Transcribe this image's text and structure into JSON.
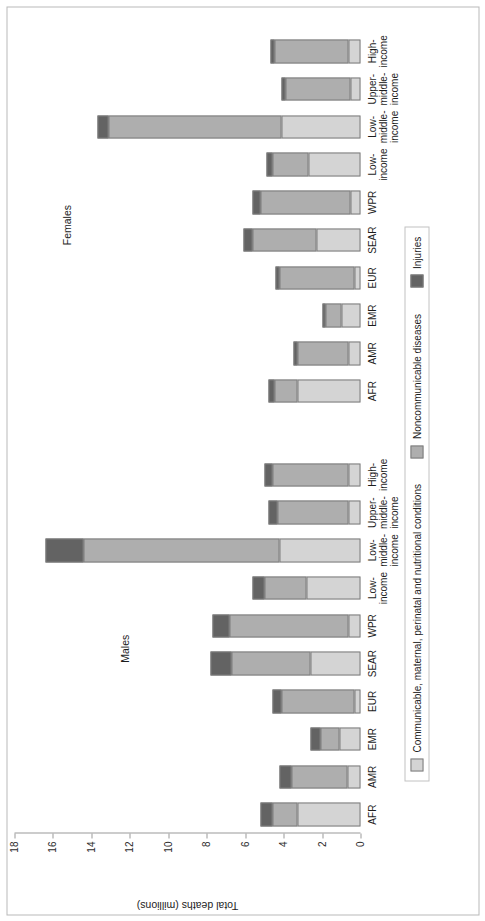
{
  "chart_data": {
    "type": "bar",
    "subtype": "stacked-bar",
    "title": "",
    "xlabel": "",
    "ylabel": "Total deaths (millions)",
    "ylim": [
      0,
      18
    ],
    "yticks": [
      0,
      2,
      4,
      6,
      8,
      10,
      12,
      14,
      16,
      18
    ],
    "grid": false,
    "orientation": "vertical-bars-rotated-90",
    "legend_position": "bottom",
    "groups": [
      "Males",
      "Females"
    ],
    "categories": [
      "AFR",
      "AMR",
      "EMR",
      "EUR",
      "SEAR",
      "WPR",
      "Low-\nincome",
      "Low-\nmiddle-\nincome",
      "Upper-\nmiddle-\nincome",
      "High-\nincome"
    ],
    "series": [
      {
        "name": "Communicable, maternal, perinatal and nutritional conditions",
        "color": "#d4d4d4",
        "males": [
          3.3,
          0.7,
          1.1,
          0.3,
          2.6,
          0.6,
          2.8,
          4.2,
          0.6,
          0.6
        ],
        "females": [
          3.3,
          0.6,
          1.0,
          0.3,
          2.3,
          0.5,
          2.7,
          4.1,
          0.5,
          0.6
        ]
      },
      {
        "name": "Noncommunicable diseases",
        "color": "#aeaeae",
        "males": [
          1.3,
          2.9,
          1.0,
          3.8,
          4.1,
          6.2,
          2.2,
          10.2,
          3.7,
          4.0
        ],
        "females": [
          1.2,
          2.7,
          0.8,
          3.9,
          3.3,
          4.7,
          1.9,
          9.0,
          3.4,
          3.9
        ]
      },
      {
        "name": "Injuries",
        "color": "#636363",
        "males": [
          0.6,
          0.6,
          0.5,
          0.5,
          1.1,
          0.9,
          0.6,
          2.0,
          0.5,
          0.4
        ],
        "females": [
          0.3,
          0.2,
          0.2,
          0.2,
          0.5,
          0.4,
          0.3,
          0.6,
          0.2,
          0.2
        ]
      }
    ],
    "totals": {
      "males": [
        5.2,
        4.2,
        2.6,
        4.6,
        7.8,
        7.7,
        5.6,
        16.4,
        4.8,
        5.0
      ],
      "females": [
        4.8,
        3.5,
        2.0,
        4.4,
        6.1,
        5.6,
        4.9,
        13.7,
        4.1,
        4.7
      ]
    }
  },
  "axis": {
    "ylabel": "Total deaths (millions)",
    "tick_labels": [
      "0",
      "2",
      "4",
      "6",
      "8",
      "10",
      "12",
      "14",
      "16",
      "18"
    ]
  },
  "group_labels": {
    "males": "Males",
    "females": "Females"
  },
  "category_labels": [
    "AFR",
    "AMR",
    "EMR",
    "EUR",
    "SEAR",
    "WPR",
    "Low-\nincome",
    "Low-\nmiddle-\nincome",
    "Upper-\nmiddle-\nincome",
    "High-\nincome"
  ],
  "legend": {
    "items": [
      {
        "label": "Communicable, maternal, perinatal and nutritional conditions",
        "color": "#d4d4d4"
      },
      {
        "label": "Noncommunicable diseases",
        "color": "#aeaeae"
      },
      {
        "label": "Injuries",
        "color": "#636363"
      }
    ]
  }
}
